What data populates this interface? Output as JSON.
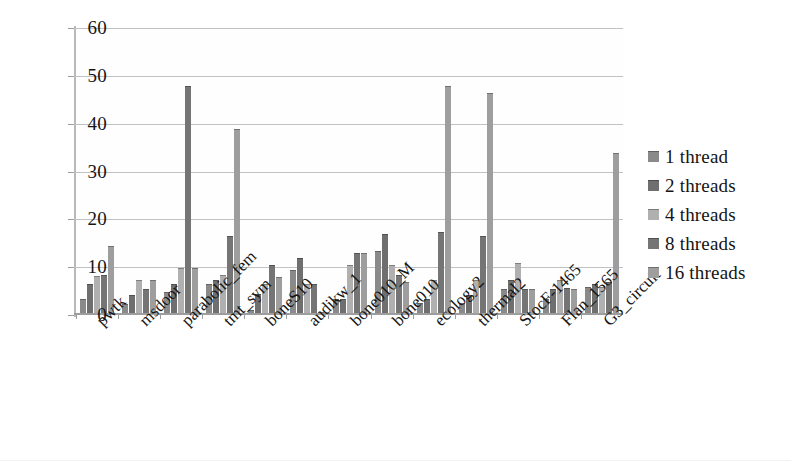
{
  "chart_data": {
    "type": "bar",
    "title": "",
    "xlabel": "",
    "ylabel": "",
    "ylim": [
      0,
      60
    ],
    "ytick_labels": [
      "60",
      "50",
      "40",
      "30",
      "20",
      "10",
      "0"
    ],
    "ytick_values": [
      60,
      50,
      40,
      30,
      20,
      10,
      0
    ],
    "grid": true,
    "legend_position": "right",
    "categories": [
      "pwtk",
      "msdoor",
      "parabolic_fem",
      "tmt_sym",
      "boneS10",
      "audikw_1",
      "bone010_M",
      "bone010",
      "ecology2",
      "thermal2",
      "StocF-1465",
      "Flan_1565",
      "G3_circuit"
    ],
    "series": [
      {
        "name": "1 thread",
        "color": "#8a8a8a",
        "values": [
          3.0,
          1.8,
          4.3,
          6.0,
          0.6,
          9.0,
          3.0,
          13.0,
          2.0,
          2.0,
          5.0,
          3.0,
          5.5
        ]
      },
      {
        "name": "2 threads",
        "color": "#6f6f6f",
        "values": [
          6.0,
          3.8,
          6.0,
          7.0,
          4.0,
          11.5,
          3.0,
          16.5,
          3.0,
          3.8,
          7.0,
          5.0,
          6.0
        ]
      },
      {
        "name": "4 threads",
        "color": "#b0b0b0",
        "values": [
          7.8,
          7.0,
          9.5,
          8.0,
          6.0,
          6.0,
          10.0,
          10.0,
          7.0,
          7.0,
          10.5,
          7.0,
          5.5
        ]
      },
      {
        "name": "8 threads",
        "color": "#757575",
        "values": [
          8.0,
          5.0,
          47.5,
          16.0,
          10.0,
          6.0,
          12.5,
          8.0,
          17.0,
          16.0,
          5.0,
          5.2,
          6.5
        ]
      },
      {
        "name": "16 threads",
        "color": "#9e9e9e",
        "values": [
          14.0,
          7.0,
          9.5,
          38.5,
          7.5,
          0.3,
          12.5,
          6.5,
          47.5,
          46.0,
          5.0,
          5.0,
          33.5
        ]
      }
    ]
  },
  "legend": {
    "items": [
      {
        "label": "1 thread"
      },
      {
        "label": "2 threads"
      },
      {
        "label": "4 threads"
      },
      {
        "label": "8 threads"
      },
      {
        "label": "16 threads"
      }
    ]
  }
}
